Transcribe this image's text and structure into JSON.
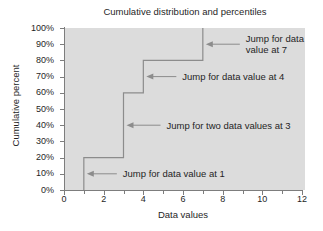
{
  "chart_data": {
    "type": "line",
    "subtype": "step-cumulative-distribution",
    "title": "Cumulative distribution and percentiles",
    "xlabel": "Data values",
    "ylabel": "Cumulative percent",
    "xlim": [
      0,
      12
    ],
    "ylim": [
      0,
      100
    ],
    "grid": false,
    "legend": "none",
    "x_major_tick_step": 2,
    "x_minor_tick_step": 1,
    "y_major_tick_step": 10,
    "x_tick_labels": [
      "0",
      "2",
      "4",
      "6",
      "8",
      "10",
      "12"
    ],
    "x_tick_values": [
      0,
      2,
      4,
      6,
      8,
      10,
      12
    ],
    "x_minor_tick_values": [
      1,
      3,
      5,
      7,
      9,
      11
    ],
    "y_tick_labels": [
      "0%",
      "10%",
      "20%",
      "30%",
      "40%",
      "50%",
      "60%",
      "70%",
      "80%",
      "90%",
      "100%"
    ],
    "y_tick_values": [
      0,
      10,
      20,
      30,
      40,
      50,
      60,
      70,
      80,
      90,
      100
    ],
    "steps": [
      {
        "x": 1,
        "from_percent": 0,
        "to_percent": 20,
        "count": 1
      },
      {
        "x": 3,
        "from_percent": 20,
        "to_percent": 60,
        "count": 2
      },
      {
        "x": 4,
        "from_percent": 60,
        "to_percent": 80,
        "count": 1
      },
      {
        "x": 7,
        "from_percent": 80,
        "to_percent": 100,
        "count": 1
      }
    ],
    "points": [
      {
        "x": 1,
        "y": 0
      },
      {
        "x": 1,
        "y": 20
      },
      {
        "x": 3,
        "y": 20
      },
      {
        "x": 3,
        "y": 60
      },
      {
        "x": 4,
        "y": 60
      },
      {
        "x": 4,
        "y": 80
      },
      {
        "x": 7,
        "y": 80
      },
      {
        "x": 7,
        "y": 100
      }
    ],
    "annotations": [
      {
        "id": "jump-7",
        "text": "Jump for data\nvalue at 7",
        "target_x": 7,
        "target_y": 90
      },
      {
        "id": "jump-4",
        "text": "Jump for data value at 4",
        "target_x": 4,
        "target_y": 70
      },
      {
        "id": "jump-3",
        "text": "Jump for two data values at 3",
        "target_x": 3,
        "target_y": 40
      },
      {
        "id": "jump-1",
        "text": "Jump for data value at 1",
        "target_x": 1,
        "target_y": 10
      }
    ],
    "colors": {
      "plot_background": "#dcdcdc",
      "figure_background": "#ffffff",
      "line": "#8c8c8c",
      "axis": "#7d7d7d",
      "text": "#1f1f1f",
      "annotation_arrow": "#8c8c8c"
    }
  }
}
